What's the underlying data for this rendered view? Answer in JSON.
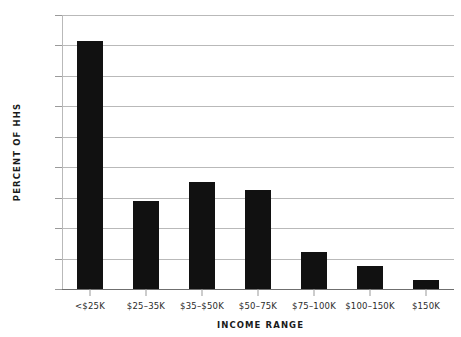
{
  "chart_data": {
    "type": "bar",
    "title": "",
    "xlabel": "INCOME RANGE",
    "ylabel": "PERCENT OF HHS",
    "categories": [
      "<$25K",
      "$25–35K",
      "$35–$50K",
      "$50–75K",
      "$75–100K",
      "$100–150K",
      "$150K"
    ],
    "values": [
      40.8,
      14.4,
      17.6,
      16.3,
      6.0,
      3.8,
      1.4
    ],
    "ylim": [
      0,
      45
    ],
    "ytick_labels": [
      "0",
      "5",
      "10",
      "15",
      "20",
      "25",
      "30",
      "35",
      "40",
      "45"
    ],
    "ytick_values": [
      0,
      5,
      10,
      15,
      20,
      25,
      30,
      35,
      40,
      45
    ],
    "grid": "horizontal",
    "legend": "none",
    "bar_color": "#111111",
    "grid_color": "#b9b9b9",
    "axis_color": "#6f6f6f",
    "text_color": "#2b2b2b"
  }
}
